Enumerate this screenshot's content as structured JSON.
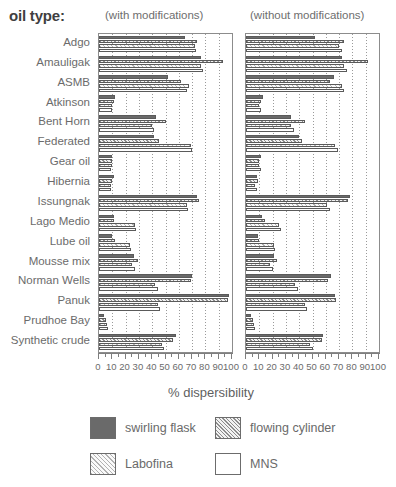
{
  "title": "oil type:",
  "panels": {
    "left_caption": "(with modifications)",
    "right_caption": "(without modifications)"
  },
  "xaxis_title": "% dispersibility",
  "tick_labels": [
    "0",
    "10",
    "20",
    "30",
    "40",
    "50",
    "60",
    "70",
    "80",
    "90",
    "100"
  ],
  "legend": [
    {
      "label": "swirling flask",
      "pattern": "solid-dark"
    },
    {
      "label": "flowing cylinder",
      "pattern": "diagonal-hatch"
    },
    {
      "label": "Labofina",
      "pattern": "light-diagonal-hatch"
    },
    {
      "label": "MNS",
      "pattern": "empty-white"
    }
  ],
  "chart_data": {
    "type": "bar",
    "orientation": "horizontal",
    "title": "oil type:",
    "xlabel": "% dispersibility",
    "ylabel": "oil type",
    "xlim": [
      0,
      100
    ],
    "grid": true,
    "grid_interval": 10,
    "legend_position": "bottom",
    "series_names": [
      "swirling flask",
      "flowing cylinder",
      "Labofina",
      "MNS"
    ],
    "categories": [
      "Adgo",
      "Amauligak",
      "ASMB",
      "Atkinson",
      "Bent Horn",
      "Federated",
      "Gear oil",
      "Hibernia",
      "Issungnak",
      "Lago Medio",
      "Lube oil",
      "Mousse mix",
      "Norman Wells",
      "Panuk",
      "Prudhoe Bay",
      "Synthetic crude"
    ],
    "panels": [
      {
        "name": "with modifications",
        "series": [
          {
            "name": "swirling flask",
            "values": [
              65,
              77,
              52,
              12,
              43,
              41,
              10,
              11,
              74,
              11,
              10,
              26,
              70,
              98,
              4,
              58
            ]
          },
          {
            "name": "flowing cylinder",
            "values": [
              74,
              93,
              62,
              11,
              50,
              45,
              10,
              10,
              75,
              11,
              12,
              29,
              69,
              97,
              5,
              56
            ]
          },
          {
            "name": "Labofina",
            "values": [
              72,
              77,
              68,
              10,
              40,
              69,
              10,
              9,
              66,
              27,
              23,
              25,
              42,
              44,
              6,
              47
            ]
          },
          {
            "name": "MNS",
            "values": [
              73,
              78,
              66,
              10,
              41,
              70,
              9,
              9,
              67,
              28,
              24,
              27,
              44,
              46,
              7,
              49
            ]
          }
        ]
      },
      {
        "name": "without modifications",
        "series": [
          {
            "name": "swirling flask",
            "values": [
              52,
              72,
              66,
              13,
              34,
              40,
              11,
              8,
              78,
              12,
              9,
              21,
              64,
              67,
              4,
              58
            ]
          },
          {
            "name": "flowing cylinder",
            "values": [
              74,
              92,
              63,
              11,
              44,
              42,
              10,
              9,
              77,
              14,
              10,
              23,
              62,
              68,
              5,
              57
            ]
          },
          {
            "name": "Labofina",
            "values": [
              70,
              74,
              72,
              10,
              34,
              67,
              10,
              7,
              61,
              25,
              21,
              18,
              37,
              44,
              6,
              48
            ]
          },
          {
            "name": "MNS",
            "values": [
              72,
              76,
              74,
              11,
              36,
              69,
              11,
              8,
              63,
              26,
              22,
              20,
              39,
              46,
              7,
              50
            ]
          }
        ]
      }
    ]
  }
}
